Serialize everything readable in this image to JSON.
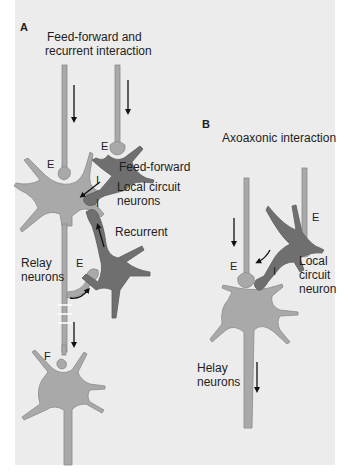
{
  "figure": {
    "panel_a": {
      "letter": "A",
      "title_line1": "Feed-forward and",
      "title_line2": "recurrent interaction",
      "labels": {
        "feed_forward": "Feed-forward",
        "local_circuit_line1": "Local circuit",
        "local_circuit_line2": "neurons",
        "recurrent": "Recurrent",
        "relay_line1": "Relay",
        "relay_line2": "neurons"
      },
      "synapse_marks": {
        "e_top": "E",
        "e_soma": "E",
        "e_recurrent": "E",
        "f_lower": "F",
        "i_upper": "I",
        "i_lower": "I"
      }
    },
    "panel_b": {
      "letter": "B",
      "title": "Axoaxonic interaction",
      "labels": {
        "local_circuit_line1": "Local",
        "local_circuit_line2": "circuit",
        "local_circuit_line3": "neuron",
        "relay_line1": "Helay",
        "relay_line2": "neurons"
      },
      "synapse_marks": {
        "e_right": "E",
        "e_left": "E",
        "i": "I"
      }
    },
    "colors": {
      "background": "#ececec",
      "relay_neuron": "#a9a9a9",
      "local_neuron": "#6f6f6f",
      "outline": "#8a8a8a",
      "arrow": "#111111"
    }
  }
}
